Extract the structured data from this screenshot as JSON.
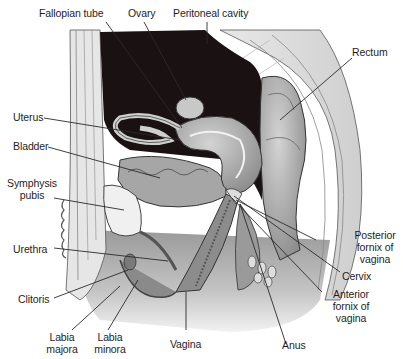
{
  "figure": {
    "colors": {
      "background": "#ffffff",
      "peritoneal_cavity": "#1a1212",
      "tissue_light": "#e4e4e4",
      "tissue_mid": "#b4b4b4",
      "tissue_dark": "#8c8c8c",
      "outline": "#3a3a3a",
      "leader_line": "#2a2a2a",
      "label_text": "#1e1e1e"
    }
  },
  "labels": {
    "fallopian_tube": "Fallopian tube",
    "ovary": "Ovary",
    "peritoneal_cavity": "Peritoneal cavity",
    "rectum": "Rectum",
    "uterus": "Uterus",
    "bladder": "Bladder",
    "symphysis_pubis_1": "Symphysis",
    "symphysis_pubis_2": "pubis",
    "urethra": "Urethra",
    "clitoris": "Clitoris",
    "labia_majora_1": "Labia",
    "labia_majora_2": "majora",
    "labia_minora_1": "Labia",
    "labia_minora_2": "minora",
    "vagina": "Vagina",
    "anus": "Anus",
    "posterior_fornix_1": "Posterior",
    "posterior_fornix_2": "fornix of",
    "posterior_fornix_3": "vagina",
    "cervix": "Cervix",
    "anterior_fornix_1": "Anterior",
    "anterior_fornix_2": "fornix of",
    "anterior_fornix_3": "vagina"
  }
}
